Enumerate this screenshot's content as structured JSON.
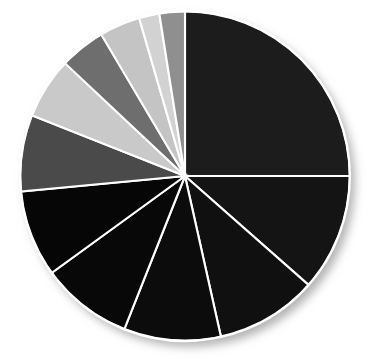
{
  "chart_data": {
    "type": "pie",
    "title": "",
    "subtitle": "",
    "xlabel": "",
    "ylabel": "",
    "grid": false,
    "legend": "none",
    "labels_shown": false,
    "total_slices": 12,
    "start_angle_deg": 270,
    "direction": "clockwise",
    "geometry": {
      "center_x": 185,
      "center_y": 176,
      "radius": 165,
      "divider_color": "#ffffff",
      "divider_width_px": 2.1,
      "background": "#ffffff",
      "shadow_color": "#b8b8b8"
    },
    "categories": [
      "Slice 1",
      "Slice 2",
      "Slice 3",
      "Slice 4",
      "Slice 5",
      "Slice 6",
      "Slice 7",
      "Slice 8",
      "Slice 9",
      "Slice 10",
      "Slice 11",
      "Slice 12"
    ],
    "values": [
      25.0,
      11.5,
      10.0,
      9.5,
      9.0,
      8.5,
      7.5,
      6.0,
      4.5,
      4.0,
      2.0,
      2.5
    ],
    "colors": [
      "#1c1c1c",
      "#141414",
      "#101010",
      "#0c0c0c",
      "#080808",
      "#060606",
      "#4a4a4a",
      "#c9c9c9",
      "#6e6e6e",
      "#c4c4c4",
      "#d2d2d2",
      "#8f8f8f"
    ],
    "slices": [
      {
        "label": "Slice 1",
        "value": 25.0,
        "percent": "25.0%",
        "color": "#1c1c1c",
        "start_deg": 270.0,
        "end_deg": 360.0
      },
      {
        "label": "Slice 2",
        "value": 11.5,
        "percent": "11.5%",
        "color": "#141414",
        "start_deg": 0.0,
        "end_deg": 41.4
      },
      {
        "label": "Slice 3",
        "value": 10.0,
        "percent": "10.0%",
        "color": "#101010",
        "start_deg": 41.4,
        "end_deg": 77.4
      },
      {
        "label": "Slice 4",
        "value": 9.5,
        "percent": "9.5%",
        "color": "#0c0c0c",
        "start_deg": 77.4,
        "end_deg": 111.6
      },
      {
        "label": "Slice 5",
        "value": 9.0,
        "percent": "9.0%",
        "color": "#080808",
        "start_deg": 111.6,
        "end_deg": 144.0
      },
      {
        "label": "Slice 6",
        "value": 8.5,
        "percent": "8.5%",
        "color": "#060606",
        "start_deg": 144.0,
        "end_deg": 174.6
      },
      {
        "label": "Slice 7",
        "value": 7.5,
        "percent": "7.5%",
        "color": "#4a4a4a",
        "start_deg": 174.6,
        "end_deg": 201.6
      },
      {
        "label": "Slice 8",
        "value": 6.0,
        "percent": "6.0%",
        "color": "#c9c9c9",
        "start_deg": 201.6,
        "end_deg": 223.2
      },
      {
        "label": "Slice 9",
        "value": 4.5,
        "percent": "4.5%",
        "color": "#6e6e6e",
        "start_deg": 223.2,
        "end_deg": 239.4
      },
      {
        "label": "Slice 10",
        "value": 4.0,
        "percent": "4.0%",
        "color": "#c4c4c4",
        "start_deg": 239.4,
        "end_deg": 253.8
      },
      {
        "label": "Slice 11",
        "value": 2.0,
        "percent": "2.0%",
        "color": "#d2d2d2",
        "start_deg": 253.8,
        "end_deg": 261.0
      },
      {
        "label": "Slice 12",
        "value": 2.5,
        "percent": "2.5%",
        "color": "#8f8f8f",
        "start_deg": 261.0,
        "end_deg": 270.0
      }
    ]
  }
}
